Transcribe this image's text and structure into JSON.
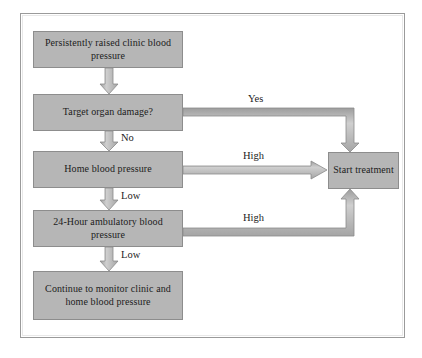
{
  "diagram": {
    "background_color": "#ffffff",
    "frame_color": "#9a9a9a",
    "node_fill": "#b6b6b6",
    "node_border": "#8d8d8d",
    "arrow_fill": "#b0b0b0",
    "arrow_border": "#8a8a8a",
    "text_color": "#1c1c1c"
  },
  "nodes": [
    {
      "id": "clinic-bp",
      "text": "Persistently raised clinic blood pressure"
    },
    {
      "id": "target-organ",
      "text": "Target organ damage?"
    },
    {
      "id": "home-bp",
      "text": "Home blood pressure"
    },
    {
      "id": "ambulatory-bp",
      "text": "24-Hour ambulatory blood pressure"
    },
    {
      "id": "continue-monitor",
      "text": "Continue to monitor clinic and home blood pressure"
    },
    {
      "id": "start-treatment",
      "text": "Start treatment"
    }
  ],
  "edge_labels": {
    "yes": "Yes",
    "no": "No",
    "high_home": "High",
    "low_home": "Low",
    "high_ambulatory": "High",
    "low_ambulatory": "Low"
  }
}
